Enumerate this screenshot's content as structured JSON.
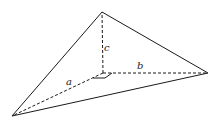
{
  "diagram": {
    "type": "tetrahedron",
    "vertices": {
      "top": [
        102,
        12
      ],
      "left": [
        12,
        116
      ],
      "right": [
        208,
        73
      ],
      "origin": [
        103,
        73
      ]
    },
    "edges_solid": [
      [
        "top",
        "left"
      ],
      [
        "top",
        "right"
      ],
      [
        "left",
        "right"
      ]
    ],
    "edges_dashed": [
      [
        "origin",
        "top"
      ],
      [
        "origin",
        "left"
      ],
      [
        "origin",
        "right"
      ]
    ],
    "labels": {
      "a": "a",
      "b": "b",
      "c": "c"
    },
    "right_angle_marker": true,
    "colors": {
      "line": "#1a1a1a",
      "background": "#ffffff"
    }
  }
}
